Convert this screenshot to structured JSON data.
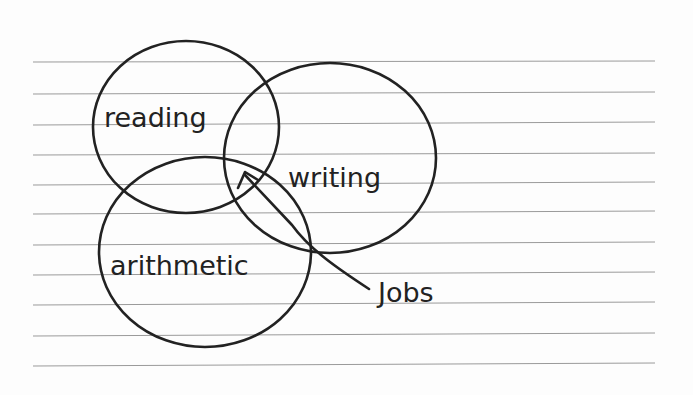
{
  "diagram": {
    "type": "venn",
    "background": "lined paper",
    "ink_color": "#222222",
    "rule_color": "#9a9a9a",
    "sets": [
      {
        "id": "reading",
        "label": "reading"
      },
      {
        "id": "writing",
        "label": "writing"
      },
      {
        "id": "arithmetic",
        "label": "arithmetic"
      }
    ],
    "annotation": {
      "label": "Jobs",
      "points_to": "intersection of reading, writing and arithmetic"
    }
  }
}
